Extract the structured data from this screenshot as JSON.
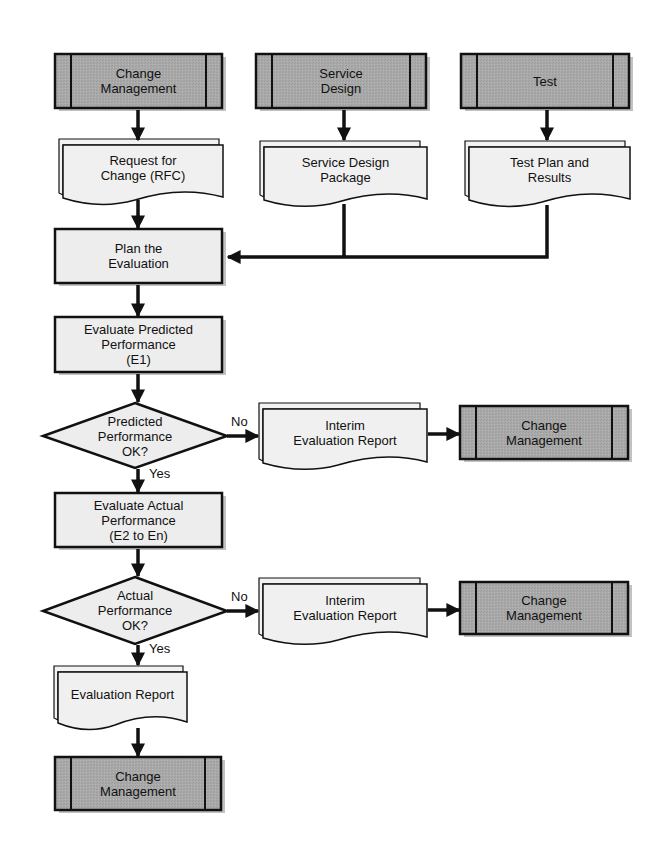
{
  "diagram": {
    "colors": {
      "predefined_fill": "#a9a9a9",
      "process_fill": "#ededed",
      "document_fill": "#f0f0f0",
      "stroke": "#111111",
      "shadow": "#9a9a9a"
    },
    "nodes": {
      "cm_top": {
        "type": "predefined-process",
        "label": "Change\nManagement"
      },
      "service_design": {
        "type": "predefined-process",
        "label": "Service\nDesign"
      },
      "test": {
        "type": "predefined-process",
        "label": "Test"
      },
      "rfc": {
        "type": "multi-document",
        "label": "Request for\nChange (RFC)"
      },
      "sdp": {
        "type": "multi-document",
        "label": "Service Design\nPackage"
      },
      "test_plan": {
        "type": "multi-document",
        "label": "Test Plan and\nResults"
      },
      "plan_eval": {
        "type": "process",
        "label": "Plan the\nEvaluation"
      },
      "eval_predicted": {
        "type": "process",
        "label": "Evaluate Predicted\nPerformance\n(E1)"
      },
      "dec_predicted": {
        "type": "decision",
        "label": "Predicted\nPerformance\nOK?"
      },
      "interim1": {
        "type": "multi-document",
        "label": "Interim\nEvaluation Report"
      },
      "cm_right1": {
        "type": "predefined-process",
        "label": "Change\nManagement"
      },
      "eval_actual": {
        "type": "process",
        "label": "Evaluate Actual\nPerformance\n(E2 to En)"
      },
      "dec_actual": {
        "type": "decision",
        "label": "Actual\nPerformance\nOK?"
      },
      "interim2": {
        "type": "multi-document",
        "label": "Interim\nEvaluation Report"
      },
      "cm_right2": {
        "type": "predefined-process",
        "label": "Change\nManagement"
      },
      "eval_report": {
        "type": "multi-document",
        "label": "Evaluation Report"
      },
      "cm_bottom": {
        "type": "predefined-process",
        "label": "Change\nManagement"
      }
    },
    "edge_labels": {
      "pred_no": "No",
      "pred_yes": "Yes",
      "act_no": "No",
      "act_yes": "Yes"
    },
    "edges": [
      {
        "from": "cm_top",
        "to": "rfc"
      },
      {
        "from": "service_design",
        "to": "sdp"
      },
      {
        "from": "test",
        "to": "test_plan"
      },
      {
        "from": "rfc",
        "to": "plan_eval"
      },
      {
        "from": "sdp",
        "to": "plan_eval"
      },
      {
        "from": "test_plan",
        "to": "plan_eval"
      },
      {
        "from": "plan_eval",
        "to": "eval_predicted"
      },
      {
        "from": "eval_predicted",
        "to": "dec_predicted"
      },
      {
        "from": "dec_predicted",
        "to": "interim1",
        "label": "No"
      },
      {
        "from": "interim1",
        "to": "cm_right1"
      },
      {
        "from": "dec_predicted",
        "to": "eval_actual",
        "label": "Yes"
      },
      {
        "from": "eval_actual",
        "to": "dec_actual"
      },
      {
        "from": "dec_actual",
        "to": "interim2",
        "label": "No"
      },
      {
        "from": "interim2",
        "to": "cm_right2"
      },
      {
        "from": "dec_actual",
        "to": "eval_report",
        "label": "Yes"
      },
      {
        "from": "eval_report",
        "to": "cm_bottom"
      }
    ]
  }
}
